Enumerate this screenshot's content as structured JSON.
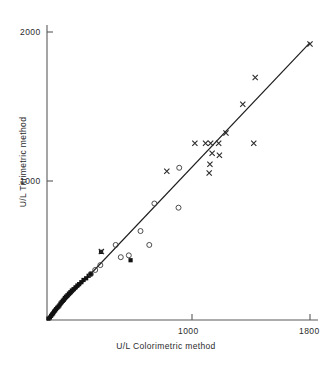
{
  "chart_data": {
    "type": "scatter",
    "title": "",
    "xlabel": "U/L Colorimetric method",
    "ylabel": "U/L Titrimetric method",
    "xlim": [
      0,
      1800
    ],
    "ylim": [
      0,
      2060
    ],
    "xticks": [
      1000,
      1800
    ],
    "xtick_labels": [
      "1000",
      "1800"
    ],
    "yticks": [
      1000,
      2000
    ],
    "ytick_labels": [
      "1000",
      "2000"
    ],
    "grid": false,
    "legend": "none",
    "identity_line": {
      "description": "line of identity / regression line",
      "x": [
        0,
        1800
      ],
      "y": [
        0,
        1995
      ],
      "color": "#1d1d1d"
    },
    "series": [
      {
        "name": "filled-square",
        "marker": "filled-square",
        "color": "#111111",
        "points": [
          [
            10,
            10
          ],
          [
            20,
            18
          ],
          [
            28,
            30
          ],
          [
            35,
            40
          ],
          [
            42,
            48
          ],
          [
            48,
            60
          ],
          [
            55,
            68
          ],
          [
            62,
            78
          ],
          [
            70,
            88
          ],
          [
            78,
            96
          ],
          [
            85,
            105
          ],
          [
            92,
            118
          ],
          [
            100,
            128
          ],
          [
            108,
            138
          ],
          [
            115,
            146
          ],
          [
            122,
            158
          ],
          [
            130,
            168
          ],
          [
            140,
            178
          ],
          [
            150,
            190
          ],
          [
            160,
            200
          ],
          [
            170,
            212
          ],
          [
            182,
            222
          ],
          [
            195,
            235
          ],
          [
            208,
            248
          ],
          [
            220,
            258
          ],
          [
            235,
            272
          ],
          [
            250,
            288
          ],
          [
            268,
            300
          ],
          [
            285,
            318
          ],
          [
            300,
            332
          ],
          [
            370,
            490
          ],
          [
            572,
            430
          ]
        ]
      },
      {
        "name": "open-circle",
        "marker": "open-circle",
        "color": "#3a3a3a",
        "points": [
          [
            300,
            330
          ],
          [
            330,
            360
          ],
          [
            365,
            395
          ],
          [
            470,
            540
          ],
          [
            505,
            452
          ],
          [
            560,
            465
          ],
          [
            640,
            640
          ],
          [
            700,
            540
          ],
          [
            735,
            838
          ],
          [
            900,
            808
          ],
          [
            905,
            1095
          ]
        ]
      },
      {
        "name": "cross",
        "marker": "cross",
        "color": "#2a2a2a",
        "points": [
          [
            372,
            492
          ],
          [
            820,
            1070
          ],
          [
            1012,
            1272
          ],
          [
            1085,
            1272
          ],
          [
            1120,
            1272
          ],
          [
            1130,
            1200
          ],
          [
            1115,
            1120
          ],
          [
            1110,
            1058
          ],
          [
            1175,
            1272
          ],
          [
            1180,
            1185
          ],
          [
            1225,
            1345
          ],
          [
            1340,
            1552
          ],
          [
            1415,
            1272
          ],
          [
            1425,
            1745
          ],
          [
            1800,
            1985
          ]
        ]
      }
    ]
  }
}
